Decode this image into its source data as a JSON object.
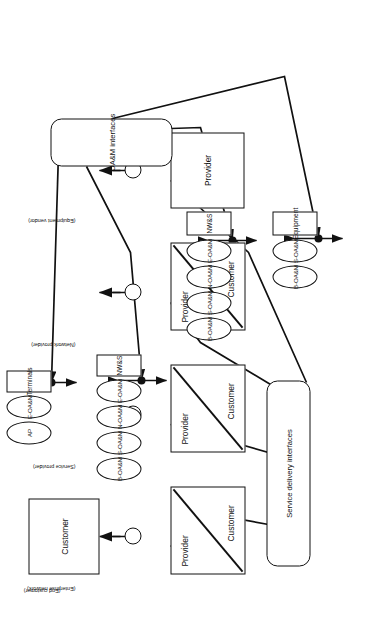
{
  "figure": {
    "orientation": "rotated-90-ccw",
    "page_size": {
      "width": 373,
      "height": 632
    }
  },
  "groups": {
    "service_delivery": {
      "label": "Service delivery interfaces"
    },
    "oam": {
      "label": "OA&M interfaces"
    }
  },
  "layers": [
    {
      "id": "end-customer",
      "paren": "(End customer)",
      "box_kind": "single",
      "top_label": "Customer",
      "bottom_label": ""
    },
    {
      "id": "enterprise-network",
      "paren": "(Enterprise network)",
      "box_kind": "split",
      "top_label": "Provider",
      "bottom_label": "Customer"
    },
    {
      "id": "service-provider",
      "paren": "(Service provider)",
      "box_kind": "split",
      "top_label": "Provider",
      "bottom_label": "Customer"
    },
    {
      "id": "network-provider",
      "paren": "(Network provider)",
      "box_kind": "split",
      "top_label": "Provider",
      "bottom_label": "Customer"
    },
    {
      "id": "equipment-vendor",
      "paren": "(Equipment vendor)",
      "box_kind": "single",
      "top_label": "Provider",
      "bottom_label": ""
    }
  ],
  "oam_rows": [
    {
      "id": "row-terminals",
      "ovals": [
        "AP",
        "E-OA&M"
      ],
      "endpoint": "Terminals"
    },
    {
      "id": "row-nws-1",
      "ovals": [
        "B-OA&M",
        "S-OA&M",
        "N-OA&M",
        "E-OA&M"
      ],
      "endpoint": "NW&S"
    },
    {
      "id": "row-nws-2",
      "ovals": [
        "B-OA&M",
        "S-OA&M",
        "N-OA&M",
        "E-OA&M"
      ],
      "endpoint": "NW&S"
    },
    {
      "id": "row-equipment",
      "ovals": [
        "B-OA&M",
        "S-OA&M"
      ],
      "endpoint": "Equipment"
    }
  ],
  "colors": {
    "stroke": "#111111",
    "background": "#ffffff",
    "text": "#1a1a1a"
  }
}
